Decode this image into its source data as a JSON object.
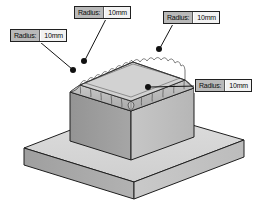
{
  "canvas": {
    "width": 264,
    "height": 214,
    "background": "#ffffff"
  },
  "diagram": {
    "type": "cad-isometric-solid",
    "parts": [
      {
        "name": "base-plate",
        "shape": "rectangular-slab"
      },
      {
        "name": "boss",
        "shape": "rectangular-block"
      },
      {
        "name": "top-fillets",
        "shape": "rounded-edge-band"
      }
    ],
    "colors": {
      "top_face": "#d7d7d7",
      "left_face": "#a8a8a8",
      "right_face": "#c4c4c4",
      "boss_top": "#cdcdcd",
      "boss_left": "#9a9a9a",
      "boss_right": "#c0c0c0",
      "fillet_band": "#bdbdbd",
      "outline": "#1e1e1e",
      "hidden_line": "#4a4a4a",
      "leader": "#1a1a1a",
      "dot": "#101010"
    }
  },
  "callouts": [
    {
      "id": "callout-top-left",
      "key": "Radius:",
      "value": "10mm"
    },
    {
      "id": "callout-far-left",
      "key": "Radius:",
      "value": "10mm"
    },
    {
      "id": "callout-top-right",
      "key": "Radius:",
      "value": "10mm"
    },
    {
      "id": "callout-low-right",
      "key": "Radius:",
      "value": "10mm"
    }
  ]
}
